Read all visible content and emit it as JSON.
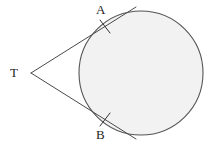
{
  "figure": {
    "width": 211,
    "height": 147,
    "background_color": "#ffffff"
  },
  "style": {
    "stroke_color": "#4a4a4a",
    "stroke_color_dark": "#333333",
    "circle_fill": "#f2f2f2",
    "circle_stroke": "#555555",
    "label_color": "#1d1d1d",
    "stroke_width": 1,
    "circle_stroke_width": 1.1,
    "tick_stroke_width": 1
  },
  "labels": {
    "external_point": "T",
    "tangent_point_upper": "A",
    "tangent_point_lower": "B"
  },
  "label_positions": {
    "T": {
      "x": 10,
      "y": 66
    },
    "A": {
      "x": 96,
      "y": 3
    },
    "B": {
      "x": 96,
      "y": 128
    }
  },
  "geometry": {
    "circle": {
      "cx": 141,
      "cy": 73,
      "r": 62
    },
    "external_point": {
      "x": 31,
      "y": 73
    },
    "tangent_point_upper": {
      "x": 105.5,
      "y": 27
    },
    "tangent_point_lower": {
      "x": 105.5,
      "y": 119.5
    },
    "tangent_upper_extension_end": {
      "x": 136,
      "y": 7
    },
    "tangent_lower_extension_end": {
      "x": 136,
      "y": 139
    },
    "tick_upper": {
      "x1": 100,
      "y1": 20,
      "x2": 110,
      "y2": 33
    },
    "tick_lower": {
      "x1": 100,
      "y1": 126,
      "x2": 110,
      "y2": 113
    }
  }
}
